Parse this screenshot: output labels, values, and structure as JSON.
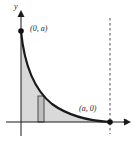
{
  "figure": {
    "name": "area-under-decreasing-curve",
    "background_color": "#ffffff",
    "ink_color": "#1a1a1a",
    "shade_color": "#d9d9d9",
    "rect_fill_color": "#bfbfbf",
    "width": 132,
    "height": 142
  },
  "axes": {
    "x_label": "x",
    "y_label": "y",
    "origin_x": 21,
    "origin_y": 122,
    "x_axis_end": 128,
    "y_axis_top": 14,
    "arrows": "both"
  },
  "labels": {
    "y_intercept": "(0, a)",
    "x_intercept": "(a, 0)"
  },
  "points": [
    {
      "name": "y-intercept-dot",
      "label": "(0, a)",
      "x": 21,
      "y": 31
    },
    {
      "name": "x-intercept-dot",
      "label": "(a, 0)",
      "x": 110,
      "y": 122
    }
  ],
  "curve": {
    "description": "decreasing convex curve from (0, a) to (a, 0)",
    "start": [
      21,
      31
    ],
    "end": [
      110,
      122
    ],
    "path": "M21,31 C24,62 32,88 52,104 C70,117 92,121 110,122"
  },
  "region": {
    "name": "shaded-area-under-curve",
    "description": "region bounded by the curve, the x-axis and the y-axis"
  },
  "rectangle": {
    "name": "representative-rectangle",
    "x": 38,
    "width": 6,
    "top": 96,
    "bottom": 122
  },
  "dashed_line": {
    "name": "vertical-asymptote-line",
    "x": 110,
    "y_top": 18,
    "y_bottom": 134,
    "style": "dashed"
  }
}
